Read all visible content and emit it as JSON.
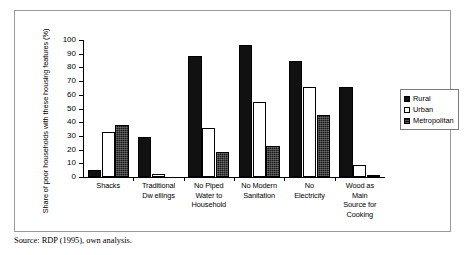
{
  "chart_data": {
    "type": "bar",
    "title": "",
    "xlabel": "",
    "ylabel": "Share of poor households with these housing features (%)",
    "ylim": [
      0,
      100
    ],
    "ytick_step": 10,
    "yticks": [
      "100",
      "90",
      "80",
      "70",
      "60",
      "50",
      "40",
      "30",
      "20",
      "10",
      "0"
    ],
    "grid": false,
    "legend_position": "right",
    "categories": [
      "Shacks",
      "Traditional Dwellings",
      "No Piped Water to Household",
      "No Modern Sanitation",
      "No Electricity",
      "Wood as Main Source for Cooking"
    ],
    "category_lines": [
      [
        "Shacks"
      ],
      [
        "Traditional",
        "Dw ellings"
      ],
      [
        "No Piped",
        "Water to",
        "Household"
      ],
      [
        "No Modern",
        "Sanitation"
      ],
      [
        "No",
        "Electricity"
      ],
      [
        "Wood as",
        "Main",
        "Source for",
        "Cooking"
      ]
    ],
    "series": [
      {
        "name": "Rural",
        "color": "#111111",
        "values": [
          5,
          29,
          88,
          96,
          85,
          66
        ]
      },
      {
        "name": "Urban",
        "color": "#ffffff",
        "values": [
          33,
          2,
          36,
          55,
          66,
          9
        ]
      },
      {
        "name": "Metropolitan",
        "color": "#1a1a1a",
        "values": [
          38,
          0,
          18,
          23,
          45,
          1
        ]
      }
    ]
  },
  "legend": {
    "items": [
      {
        "label": "Rural"
      },
      {
        "label": "Urban"
      },
      {
        "label": "Metropolitan"
      }
    ]
  },
  "footer": {
    "source": "Source: RDP (1995), own analysis."
  }
}
